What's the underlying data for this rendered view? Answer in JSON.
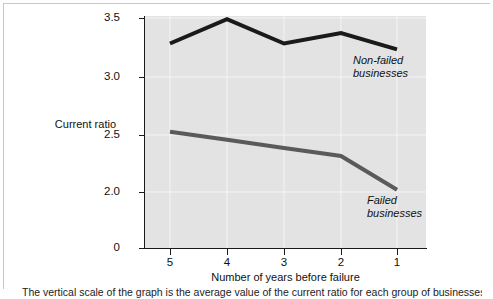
{
  "figure": {
    "caption": "The vertical scale of the graph is the average value of the current ratio for each group of businesses"
  },
  "axes": {
    "y_title": "Current\nratio",
    "x_title": "Number of years before failure",
    "y_ticks": [
      "3.5",
      "3.0",
      "2.5",
      "2.0",
      "0"
    ],
    "x_ticks": [
      "5",
      "4",
      "3",
      "2",
      "1"
    ]
  },
  "labels": {
    "non_failed": "Non-failed\nbusinesses",
    "failed": "Failed\nbusinesses"
  },
  "colors": {
    "plot_background": "#e3e3e3",
    "non_failed_line": "#1a1a1a",
    "failed_line": "#5a5a5a",
    "axis": "#1a1a1a",
    "gridline": "#f2f2f2"
  },
  "chart_data": {
    "type": "line",
    "title": "",
    "xlabel": "Number of years before failure",
    "ylabel": "Current ratio",
    "x": [
      5,
      4,
      3,
      2,
      1
    ],
    "categories": [
      "5",
      "4",
      "3",
      "2",
      "1"
    ],
    "ylim": [
      2.0,
      3.5
    ],
    "y_ticks": [
      3.5,
      3.0,
      2.5,
      2.0,
      0
    ],
    "y_axis_broken": true,
    "grid": true,
    "legend": "inline-annotations",
    "series": [
      {
        "name": "Non-failed businesses",
        "values": [
          3.28,
          3.49,
          3.28,
          3.37,
          3.23
        ],
        "color": "#1a1a1a"
      },
      {
        "name": "Failed businesses",
        "values": [
          2.52,
          2.45,
          2.38,
          2.31,
          2.02
        ],
        "color": "#5a5a5a"
      }
    ]
  }
}
